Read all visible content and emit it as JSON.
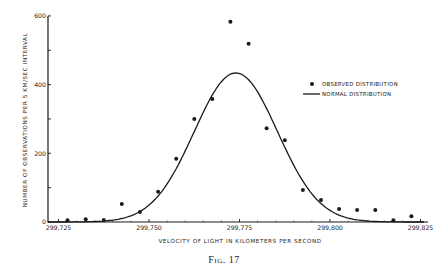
{
  "chart_data": {
    "type": "scatter",
    "title": "",
    "caption": "Fig. 17",
    "xlabel": "VELOCITY OF LIGHT IN KILOMETERS PER SECOND",
    "ylabel": "NUMBER OF OBSERVATIONS PER 5 KM/SEC INTERVAL",
    "xlim": [
      299722,
      299827
    ],
    "ylim": [
      0,
      600
    ],
    "x_ticks": [
      299725,
      299750,
      299775,
      299800,
      299825
    ],
    "x_tick_labels": [
      "299,725",
      "299,750",
      "299,775",
      "299,800",
      "299,825"
    ],
    "y_ticks": [
      0,
      100,
      200,
      300,
      400,
      500,
      600
    ],
    "y_tick_labels": [
      "0",
      "",
      "200",
      "",
      "400",
      "",
      "600"
    ],
    "grid": false,
    "legend_position": "upper right",
    "series": [
      {
        "name": "OBSERVED DISTRIBUTION",
        "type": "scatter",
        "x": [
          299727.5,
          299732.5,
          299737.5,
          299742.5,
          299747.5,
          299752.5,
          299757.5,
          299762.5,
          299767.5,
          299772.5,
          299777.5,
          299782.5,
          299787.5,
          299792.5,
          299797.5,
          299802.5,
          299807.5,
          299812.5,
          299817.5,
          299822.5
        ],
        "values": [
          5,
          8,
          6,
          52,
          29,
          88,
          184,
          300,
          358,
          583,
          519,
          273,
          238,
          93,
          64,
          38,
          35,
          35,
          5,
          17
        ]
      },
      {
        "name": "NORMAL DISTRIBUTION",
        "type": "line",
        "mean": 299774,
        "peak": 434,
        "sigma": 11.5
      }
    ]
  },
  "legend": {
    "observed_label": "OBSERVED DISTRIBUTION",
    "normal_label": "NORMAL DISTRIBUTION"
  }
}
